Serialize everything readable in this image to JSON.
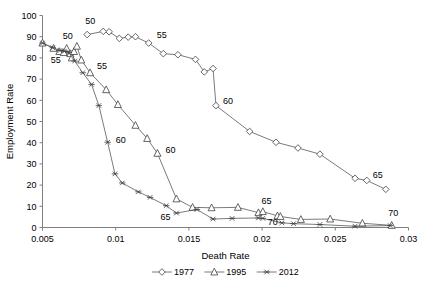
{
  "chart_data": {
    "type": "line",
    "title": "",
    "xlabel": "Death Rate",
    "ylabel": "Employment Rate",
    "xlim": [
      0.005,
      0.03
    ],
    "ylim": [
      0,
      100
    ],
    "xticks": [
      "0.005",
      "0.01",
      "0.015",
      "0.02",
      "0.025",
      "0.03"
    ],
    "xtick_values": [
      0.005,
      0.01,
      0.015,
      0.02,
      0.025,
      0.03
    ],
    "yticks": [
      "0",
      "10",
      "20",
      "30",
      "40",
      "50",
      "60",
      "70",
      "80",
      "90",
      "100"
    ],
    "ytick_values": [
      0,
      10,
      20,
      30,
      40,
      50,
      60,
      70,
      80,
      90,
      100
    ],
    "grid": false,
    "legend_position": "bottom",
    "series": [
      {
        "name": "1977",
        "marker": "diamond",
        "points": [
          [
            0.00805,
            91.0
          ],
          [
            0.00915,
            92.5
          ],
          [
            0.00955,
            92.3
          ],
          [
            0.01025,
            89.2
          ],
          [
            0.01085,
            89.8
          ],
          [
            0.01135,
            90.0
          ],
          [
            0.01225,
            87.0
          ],
          [
            0.01325,
            82.0
          ],
          [
            0.01425,
            81.5
          ],
          [
            0.01545,
            79.3
          ],
          [
            0.01605,
            73.4
          ],
          [
            0.01665,
            75.0
          ],
          [
            0.01685,
            57.5
          ],
          [
            0.01915,
            45.3
          ],
          [
            0.02095,
            40.2
          ],
          [
            0.02245,
            37.5
          ],
          [
            0.02395,
            34.6
          ],
          [
            0.02635,
            23.2
          ],
          [
            0.02715,
            22.2
          ],
          [
            0.02845,
            18.0
          ]
        ],
        "annotations": [
          {
            "text": "50",
            "x": 0.00805,
            "y": 91.0,
            "dx": -2,
            "dy": -11
          },
          {
            "text": "55",
            "x": 0.01225,
            "y": 87.0,
            "dx": 8,
            "dy": -5
          },
          {
            "text": "60",
            "x": 0.01685,
            "y": 57.5,
            "dx": 7,
            "dy": -2
          },
          {
            "text": "65",
            "x": 0.02715,
            "y": 22.2,
            "dx": 6,
            "dy": -2
          }
        ]
      },
      {
        "name": "1995",
        "marker": "triangle",
        "points": [
          [
            0.005,
            87.0
          ],
          [
            0.00575,
            84.5
          ],
          [
            0.00615,
            83.0
          ],
          [
            0.00645,
            82.5
          ],
          [
            0.00665,
            84.5
          ],
          [
            0.0069,
            82.0
          ],
          [
            0.007,
            80.0
          ],
          [
            0.00715,
            83.0
          ],
          [
            0.00735,
            85.5
          ],
          [
            0.00765,
            79.0
          ],
          [
            0.00825,
            73.0
          ],
          [
            0.00935,
            65.0
          ],
          [
            0.01015,
            58.0
          ],
          [
            0.01135,
            48.2
          ],
          [
            0.01215,
            42.0
          ],
          [
            0.01285,
            35.0
          ],
          [
            0.01415,
            13.5
          ],
          [
            0.01525,
            9.5
          ],
          [
            0.01655,
            9.3
          ],
          [
            0.01835,
            9.5
          ],
          [
            0.01975,
            7.0
          ],
          [
            0.02005,
            7.5
          ],
          [
            0.02105,
            5.5
          ],
          [
            0.02125,
            5.2
          ],
          [
            0.02265,
            3.8
          ],
          [
            0.02465,
            4.0
          ],
          [
            0.02685,
            2.0
          ],
          [
            0.02885,
            1.0
          ]
        ],
        "annotations": [
          {
            "text": "50",
            "x": 0.00645,
            "y": 84.0,
            "dx": -1,
            "dy": -10
          },
          {
            "text": "55",
            "x": 0.00825,
            "y": 73.0,
            "dx": 7,
            "dy": -4
          },
          {
            "text": "60",
            "x": 0.01285,
            "y": 35.0,
            "dx": 8,
            "dy": 0
          },
          {
            "text": "65",
            "x": 0.01975,
            "y": 7.5,
            "dx": 3,
            "dy": -8
          }
        ]
      },
      {
        "name": "2012",
        "marker": "star",
        "points": [
          [
            0.005,
            87.0
          ],
          [
            0.0057,
            84.8
          ],
          [
            0.0062,
            83.5
          ],
          [
            0.0065,
            83.2
          ],
          [
            0.0068,
            82.5
          ],
          [
            0.0072,
            78.5
          ],
          [
            0.00775,
            73.0
          ],
          [
            0.00835,
            67.5
          ],
          [
            0.00885,
            57.5
          ],
          [
            0.00945,
            40.2
          ],
          [
            0.00995,
            25.3
          ],
          [
            0.01045,
            21.0
          ],
          [
            0.01155,
            16.8
          ],
          [
            0.01235,
            14.2
          ],
          [
            0.01345,
            10.3
          ],
          [
            0.01415,
            6.8
          ],
          [
            0.01555,
            8.5
          ],
          [
            0.01665,
            4.0
          ],
          [
            0.01795,
            4.3
          ],
          [
            0.01975,
            4.5
          ],
          [
            0.02005,
            4.3
          ],
          [
            0.02135,
            2.2
          ],
          [
            0.02215,
            1.8
          ],
          [
            0.02395,
            1.4
          ],
          [
            0.02635,
            0.6
          ],
          [
            0.02875,
            0.9
          ]
        ],
        "annotations": [
          {
            "text": "55",
            "x": 0.0057,
            "y": 83.0,
            "dx": -2,
            "dy": 11
          },
          {
            "text": "60",
            "x": 0.00945,
            "y": 40.2,
            "dx": 8,
            "dy": 1
          },
          {
            "text": "65",
            "x": 0.01415,
            "y": 6.8,
            "dx": -16,
            "dy": 7
          },
          {
            "text": "70",
            "x": 0.02005,
            "y": 4.3,
            "dx": 5,
            "dy": 7
          },
          {
            "text": "70",
            "x": 0.02875,
            "y": 0.9,
            "dx": -2,
            "dy": -10
          }
        ]
      }
    ],
    "legend": [
      {
        "label": "1977",
        "marker": "diamond"
      },
      {
        "label": "1995",
        "marker": "triangle"
      },
      {
        "label": "2012",
        "marker": "star"
      }
    ]
  }
}
